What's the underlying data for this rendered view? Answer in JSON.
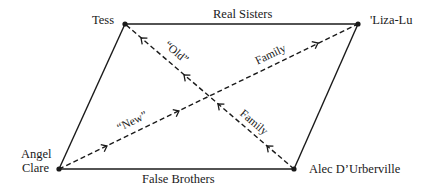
{
  "diagram": {
    "type": "parallelogram-relationship-diagram",
    "nodes": [
      {
        "id": "tess",
        "label": "Tess",
        "x": 125,
        "y": 24
      },
      {
        "id": "liza",
        "label": "'Liza-Lu",
        "x": 358,
        "y": 24
      },
      {
        "id": "angel",
        "label_line1": "Angel",
        "label_line2": "Clare",
        "x": 59,
        "y": 169
      },
      {
        "id": "alec",
        "label": "Alec D’Urberville",
        "x": 294,
        "y": 169
      }
    ],
    "edges": [
      {
        "from": "tess",
        "to": "liza",
        "style": "solid",
        "label": "Real Sisters"
      },
      {
        "from": "angel",
        "to": "alec",
        "style": "solid",
        "label": "False Brothers"
      },
      {
        "from": "angel",
        "to": "tess",
        "style": "solid",
        "label": ""
      },
      {
        "from": "alec",
        "to": "liza",
        "style": "solid",
        "label": ""
      },
      {
        "from": "angel",
        "to": "liza",
        "style": "dashed",
        "arrow": "toward Liza-Lu",
        "labels": [
          "“New”",
          "Family"
        ]
      },
      {
        "from": "alec",
        "to": "tess",
        "style": "dashed",
        "arrow": "toward Tess",
        "labels": [
          "“Old”",
          "Family"
        ]
      }
    ],
    "edge_labels": {
      "real_sisters": "Real Sisters",
      "false_brothers": "False Brothers",
      "new": "“New”",
      "family_upper": "Family",
      "old": "“Old”",
      "family_lower": "Family"
    },
    "colors": {
      "line": "#1a1a1a",
      "background": "#ffffff"
    }
  }
}
